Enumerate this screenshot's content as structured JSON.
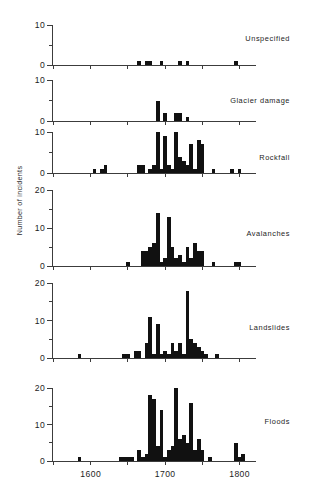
{
  "chart_data": {
    "type": "bar",
    "title": "",
    "xlabel": "",
    "ylabel": "Number of incidents",
    "xlim": [
      1548,
      1822
    ],
    "xticks": [
      1600,
      1700,
      1800
    ],
    "xticklabels": [
      "1600",
      "1700",
      "1800"
    ],
    "grid": false,
    "legend_position": "none",
    "bin_width": 5,
    "panels": [
      {
        "name": "unspecified",
        "label": "Unspecified",
        "ylim": [
          0,
          10
        ],
        "yticks": [
          0,
          5,
          10
        ],
        "yticklabels": [
          "0",
          "",
          "10"
        ],
        "ylabelled_ticks": [
          0,
          10
        ],
        "x": [
          1665,
          1675,
          1680,
          1695,
          1720,
          1730,
          1795
        ],
        "values": [
          1,
          1,
          1,
          1,
          1,
          1,
          1
        ]
      },
      {
        "name": "glacier-damage",
        "label": "Glacier damage",
        "ylim": [
          0,
          10
        ],
        "yticks": [
          0,
          5,
          10
        ],
        "yticklabels": [
          "0",
          "",
          "10"
        ],
        "ylabelled_ticks": [
          0,
          10
        ],
        "x": [
          1690,
          1700,
          1715,
          1720,
          1730
        ],
        "values": [
          5,
          2,
          2,
          2,
          1
        ]
      },
      {
        "name": "rockfall",
        "label": "Rockfall",
        "ylim": [
          0,
          10
        ],
        "yticks": [
          0,
          5,
          10
        ],
        "yticklabels": [
          "0",
          "",
          "10"
        ],
        "ylabelled_ticks": [
          0,
          10
        ],
        "x": [
          1605,
          1615,
          1620,
          1665,
          1670,
          1680,
          1685,
          1690,
          1695,
          1700,
          1705,
          1710,
          1715,
          1720,
          1725,
          1730,
          1735,
          1740,
          1745,
          1750,
          1765,
          1790,
          1800
        ],
        "values": [
          1,
          1,
          2,
          2,
          2,
          1,
          2,
          10,
          1,
          9,
          2,
          1,
          10,
          4,
          3,
          2,
          7,
          1,
          8,
          7,
          1,
          1,
          1
        ]
      },
      {
        "name": "avalanches",
        "label": "Avalanches",
        "ylim": [
          0,
          20
        ],
        "yticks": [
          0,
          5,
          10,
          15,
          20
        ],
        "yticklabels": [
          "0",
          "",
          "10",
          "",
          "20"
        ],
        "ylabelled_ticks": [
          0,
          10,
          20
        ],
        "x": [
          1650,
          1670,
          1675,
          1680,
          1685,
          1690,
          1695,
          1700,
          1705,
          1710,
          1715,
          1720,
          1725,
          1730,
          1735,
          1740,
          1745,
          1750,
          1765,
          1795,
          1800
        ],
        "values": [
          1,
          4,
          4,
          5,
          6,
          14,
          1,
          2,
          13,
          5,
          2,
          3,
          1,
          5,
          2,
          6,
          4,
          4,
          1,
          1,
          1
        ]
      },
      {
        "name": "landslides",
        "label": "Landslides",
        "ylim": [
          0,
          20
        ],
        "yticks": [
          0,
          5,
          10,
          15,
          20
        ],
        "yticklabels": [
          "0",
          "",
          "10",
          "",
          "20"
        ],
        "ylabelled_ticks": [
          0,
          10,
          20
        ],
        "x": [
          1585,
          1645,
          1650,
          1660,
          1665,
          1675,
          1680,
          1685,
          1690,
          1695,
          1700,
          1705,
          1710,
          1715,
          1720,
          1725,
          1730,
          1735,
          1740,
          1745,
          1750,
          1755,
          1770
        ],
        "values": [
          1,
          1,
          1,
          2,
          2,
          4,
          11,
          1,
          9,
          1,
          2,
          1,
          4,
          2,
          4,
          1,
          18,
          5,
          4,
          3,
          2,
          1,
          1
        ]
      },
      {
        "name": "floods",
        "label": "Floods",
        "ylim": [
          0,
          20
        ],
        "yticks": [
          0,
          5,
          10,
          15,
          20
        ],
        "yticklabels": [
          "0",
          "",
          "10",
          "",
          "20"
        ],
        "ylabelled_ticks": [
          0,
          10,
          20
        ],
        "x": [
          1585,
          1640,
          1645,
          1650,
          1655,
          1665,
          1670,
          1675,
          1680,
          1685,
          1690,
          1695,
          1700,
          1705,
          1710,
          1715,
          1720,
          1725,
          1730,
          1735,
          1740,
          1745,
          1750,
          1760,
          1795,
          1800,
          1805
        ],
        "values": [
          1,
          1,
          1,
          1,
          1,
          3,
          1,
          2,
          18,
          17,
          4,
          14,
          1,
          3,
          4,
          20,
          6,
          7,
          5,
          16,
          3,
          6,
          3,
          1,
          5,
          1,
          2
        ]
      }
    ]
  },
  "axis": {
    "x_tick_labels": [
      "1600",
      "1700",
      "1800"
    ]
  }
}
